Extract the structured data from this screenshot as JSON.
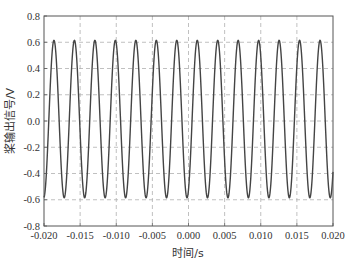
{
  "chart_data": {
    "type": "line",
    "title": "",
    "xlabel": "时间/s",
    "ylabel": "桨输出信号/V",
    "xlim": [
      -0.02,
      0.02
    ],
    "ylim": [
      -0.8,
      0.8
    ],
    "xticks": [
      -0.02,
      -0.015,
      -0.01,
      -0.005,
      0.0,
      0.005,
      0.01,
      0.015,
      0.02
    ],
    "xtick_labels": [
      "-0.020",
      "-0.015",
      "-0.010",
      "-0.005",
      "0.000",
      "0.005",
      "0.010",
      "0.015",
      "0.020"
    ],
    "yticks": [
      -0.8,
      -0.6,
      -0.4,
      -0.2,
      0.0,
      0.2,
      0.4,
      0.6,
      0.8
    ],
    "ytick_labels": [
      "-0.8",
      "-0.6",
      "-0.4",
      "-0.2",
      "0.0",
      "0.2",
      "0.4",
      "0.6",
      "0.8"
    ],
    "grid": true,
    "grid_style": "dashed",
    "legend": null,
    "series": [
      {
        "name": "output signal",
        "color": "#444444",
        "model": "sine",
        "amplitude": 0.6,
        "offset": 0.015,
        "frequency_hz": 353,
        "peak_time_s": -0.01862,
        "peaks_x": [
          -0.01862,
          -0.01579,
          -0.01296,
          -0.01012,
          -0.00729,
          -0.00446,
          -0.00163,
          0.0012,
          0.00404,
          0.00687,
          0.0097,
          0.01253,
          0.01537,
          0.0182
        ],
        "peak_value": 0.615,
        "trough_value": -0.585
      }
    ]
  },
  "colors": {
    "axis": "#555555",
    "grid": "#b0b0b0",
    "line": "#444444"
  }
}
